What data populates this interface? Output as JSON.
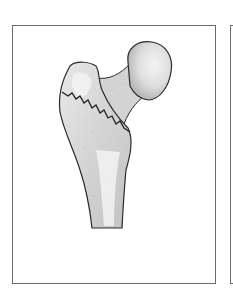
{
  "figure": {
    "panels": [
      {
        "id": "main",
        "description": "proximal femur with intertrochanteric fracture line"
      },
      {
        "id": "next",
        "description": "edge of adjacent panel (cropped)"
      }
    ],
    "colors": {
      "background": "#ffffff",
      "frame": "#6b6b6b",
      "bone_fill": "#d9d9d9",
      "bone_highlight": "#f2f2f2",
      "outline": "#2a2a2a"
    }
  }
}
